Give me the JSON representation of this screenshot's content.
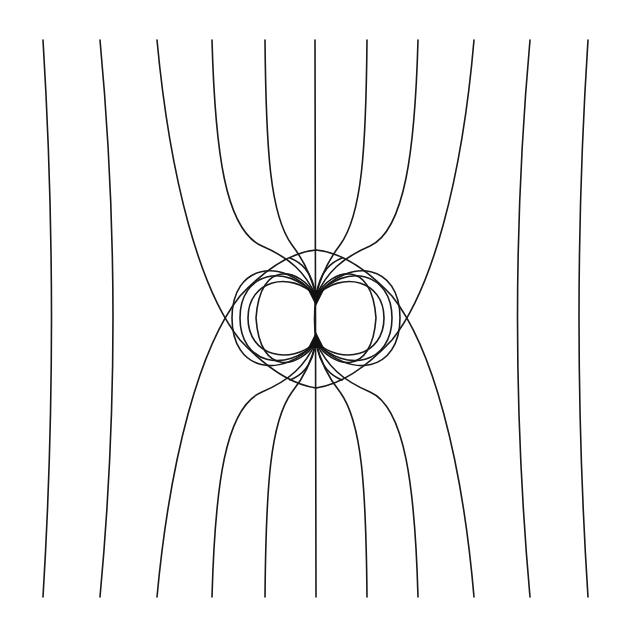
{
  "diagram": {
    "type": "field-lines",
    "stroke_color": "#1a1a1a",
    "background": "#ffffff",
    "center": {
      "x": 316,
      "y": 318
    },
    "dashed_circle_radius": 66,
    "poles": [
      {
        "name": "upper-pole",
        "x": 316,
        "y": 296
      },
      {
        "name": "lower-pole",
        "x": 316,
        "y": 342
      }
    ],
    "x_points": [
      {
        "x": 213,
        "y": 318
      },
      {
        "x": 419,
        "y": 318
      }
    ],
    "top_line_x": [
      43,
      100,
      157,
      212,
      265,
      315,
      367,
      418,
      474,
      530,
      588
    ],
    "line_top_y": 40,
    "line_bottom_y": 597
  }
}
